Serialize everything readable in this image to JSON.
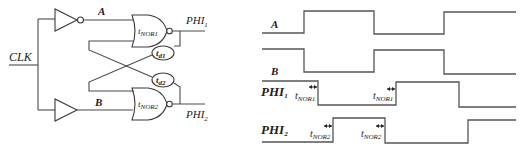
{
  "circuit": {
    "input_label": "CLK",
    "node_a_label": "A",
    "node_b_label": "B",
    "gate_top": {
      "label_main": "t",
      "label_sub": "NOR1",
      "type": "NOR"
    },
    "gate_bottom": {
      "label_main": "t",
      "label_sub": "NOR2",
      "type": "NOR"
    },
    "delay_top": {
      "label_main": "t",
      "label_sub": "d1"
    },
    "delay_bottom": {
      "label_main": "t",
      "label_sub": "d2"
    },
    "output_top": {
      "label_main": "PHI",
      "label_sub": "1"
    },
    "output_bottom": {
      "label_main": "PHI",
      "label_sub": "2"
    },
    "top_stage": "inverter",
    "bottom_stage": "buffer"
  },
  "timing": {
    "signals": [
      {
        "name": "A",
        "sub": "",
        "initial": "low",
        "transitions_x": [
          304,
          374,
          444
        ]
      },
      {
        "name": "B",
        "sub": "",
        "initial": "high",
        "transitions_x": [
          304,
          374,
          444
        ]
      },
      {
        "name": "PHI",
        "sub": "1",
        "initial": "high",
        "transitions_x": [
          318,
          396,
          459
        ]
      },
      {
        "name": "PHI",
        "sub": "2",
        "initial": "low",
        "transitions_x": [
          333,
          385,
          468
        ]
      }
    ],
    "annotations": [
      {
        "main": "t",
        "sub": "NOR1",
        "signal": "PHI1",
        "index": 1
      },
      {
        "main": "t",
        "sub": "NOR1",
        "signal": "PHI1",
        "index": 2
      },
      {
        "main": "t",
        "sub": "NOR2",
        "signal": "PHI2",
        "index": 1
      },
      {
        "main": "t",
        "sub": "NOR2",
        "signal": "PHI2",
        "index": 2
      }
    ]
  }
}
